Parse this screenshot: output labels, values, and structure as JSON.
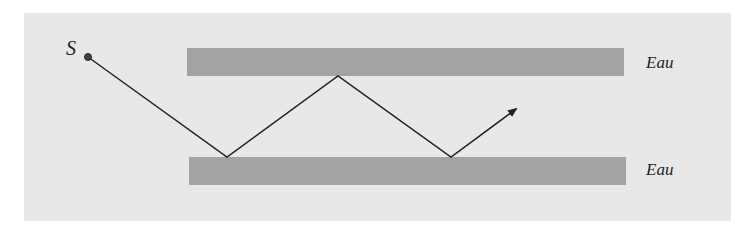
{
  "diagram": {
    "title": "",
    "source_label": "S",
    "layers": [
      {
        "label": "Eau",
        "position": "top"
      },
      {
        "label": "Eau",
        "position": "bottom"
      }
    ],
    "colors": {
      "background": "#e8e8e8",
      "layer": "#a3a3a3",
      "ray": "#222222"
    },
    "ray_path": [
      [
        88,
        57
      ],
      [
        227,
        157
      ],
      [
        338,
        76
      ],
      [
        451,
        157
      ],
      [
        516,
        109
      ]
    ]
  }
}
